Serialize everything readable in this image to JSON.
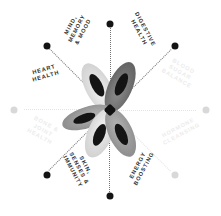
{
  "diagram": {
    "type": "radial-wheel",
    "center_motif": "butterfly-flower-petals",
    "spoke_count": 8,
    "colors": {
      "background": "#ffffff",
      "dot": "#141414",
      "dot_faint": "#d8d8d8",
      "spoke": "#5a5a5a",
      "label": "#2b2b2b",
      "label_ghost": "#ececec",
      "petal_light": "#d9d9d9",
      "petal_mid": "#9a9a9a",
      "petal_dark": "#6b6b6b",
      "petal_marking": "#141414",
      "hub": "#111111"
    },
    "segments": [
      {
        "id": "mind-memory-mood",
        "label_lines": [
          "MIND,",
          "MEMORY",
          "& MOOD"
        ],
        "angle_deg": -67,
        "state": "visible"
      },
      {
        "id": "digestive-health",
        "label_lines": [
          "DIGESTIVE",
          "HEALTH"
        ],
        "angle_deg": -23,
        "state": "visible"
      },
      {
        "id": "blood-sugar-balance",
        "label_lines": [
          "BLOOD",
          "SUGAR",
          "BALANCE"
        ],
        "angle_deg": 23,
        "state": "ghosted"
      },
      {
        "id": "hormone-cleansing",
        "label_lines": [
          "HORMONE",
          "CLEANSING"
        ],
        "angle_deg": -23,
        "state": "ghosted"
      },
      {
        "id": "energy-boosting",
        "label_lines": [
          "ENERGY",
          "BOOSTING"
        ],
        "angle_deg": 23,
        "state": "visible"
      },
      {
        "id": "skin-senses-immunity",
        "label_lines": [
          "SKIN,",
          "SENSES &",
          "IMMUNITY"
        ],
        "angle_deg": 67,
        "state": "visible"
      },
      {
        "id": "bone-joint-health",
        "label_lines": [
          "BONE &",
          "JOINT",
          "HEALTH"
        ],
        "angle_deg": -23,
        "state": "ghosted"
      },
      {
        "id": "heart-health",
        "label_lines": [
          "HEART",
          "HEALTH"
        ],
        "angle_deg": -23,
        "state": "visible"
      }
    ]
  }
}
